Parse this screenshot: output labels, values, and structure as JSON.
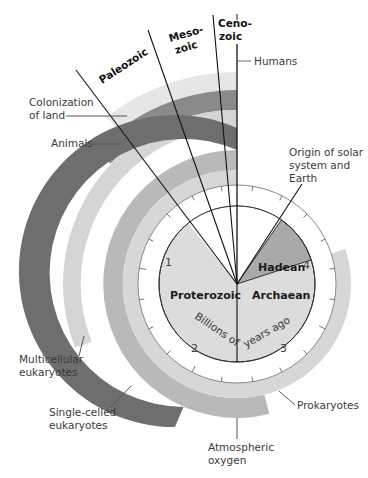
{
  "diagram": {
    "center": {
      "x": 237,
      "y": 284
    },
    "scale": {
      "unit_label_part1": "Billions of",
      "unit_label_part2": "years ago",
      "ticks": [
        "1",
        "2",
        "3",
        "4"
      ]
    },
    "eons": [
      {
        "name": "Proterozoic",
        "from": 0.541,
        "to": 2.5,
        "color": "#dcdcdc"
      },
      {
        "name": "Archaean",
        "from": 2.5,
        "to": 4.0,
        "color": "#dcdcdc"
      },
      {
        "name": "Hadean",
        "from": 4.0,
        "to": 4.6,
        "color": "#a9a9a9"
      }
    ],
    "eras": [
      {
        "name": "Paleozoic",
        "start": 0.541
      },
      {
        "name": "Meso-zoic",
        "line1": "Meso-",
        "line2": "zoic",
        "start": 0.252
      },
      {
        "name": "Ceno-zoic",
        "line1": "Ceno-",
        "line2": "zoic",
        "start": 0.066
      }
    ],
    "bands": [
      {
        "name": "Prokaryotes",
        "start": 3.5,
        "color": "#d7d7d7"
      },
      {
        "name": "Atmospheric oxygen",
        "line1": "Atmospheric",
        "line2": "oxygen",
        "start": 2.7,
        "color": "#b9b9b9"
      },
      {
        "name": "Single-celled eukaryotes",
        "line1": "Single-celled",
        "line2": "eukaryotes",
        "start": 2.1,
        "color": "#6e6e6e"
      },
      {
        "name": "Multicellular eukaryotes",
        "line1": "Multicellular",
        "line2": "eukaryotes",
        "start": 1.5,
        "color": "#d5d5d5"
      },
      {
        "name": "Animals",
        "start": 0.67,
        "color": "#8a8a8a"
      },
      {
        "name": "Colonization of land",
        "line1": "Colonization",
        "line2": "of land",
        "start": 0.5,
        "color": "#e6e6e6"
      }
    ],
    "events": {
      "humans": "Humans",
      "origin_line1": "Origin of solar",
      "origin_line2": "system and",
      "origin_line3": "Earth"
    }
  }
}
